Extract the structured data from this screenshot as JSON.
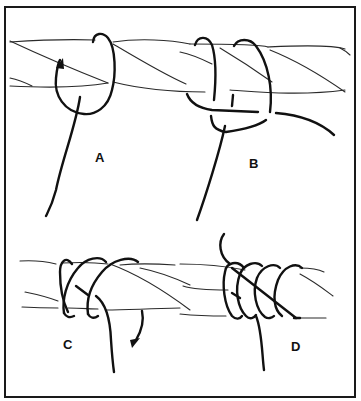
{
  "figure": {
    "colors": {
      "ink": "#111111",
      "background": "#ffffff"
    },
    "panels": [
      {
        "id": "A",
        "label": "A"
      },
      {
        "id": "B",
        "label": "B"
      },
      {
        "id": "C",
        "label": "C"
      },
      {
        "id": "D",
        "label": "D"
      }
    ]
  }
}
